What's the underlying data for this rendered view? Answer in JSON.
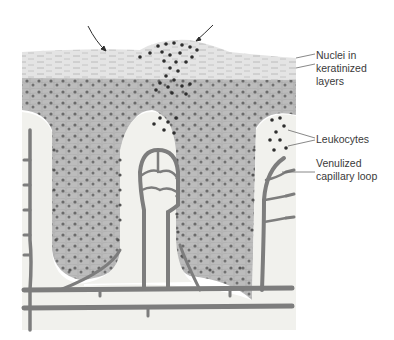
{
  "figure": {
    "labels": [
      {
        "id": "nuclei",
        "text": "Nuclei in\nkeratinized\nlayers"
      },
      {
        "id": "leukocytes",
        "text": "Leukocytes"
      },
      {
        "id": "venulized",
        "text": "Venulized\ncapillary loop"
      }
    ],
    "arrows": 2,
    "colors": {
      "background": "#ffffff",
      "keratin": "#e6e6e6",
      "epithelium": "#b9b9b9",
      "stroma": "#f1f1ed",
      "vessel": "#7d7d7d",
      "nucleus": "#5e5e5e",
      "leukocyte": "#2e2e2e",
      "leader_line": "#6a6a6a",
      "text": "#3a3a3a"
    }
  }
}
